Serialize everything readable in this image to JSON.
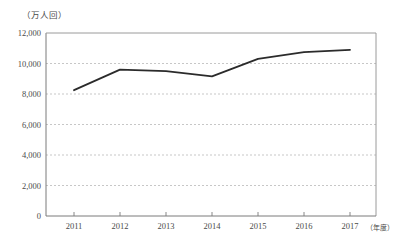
{
  "chart_data": {
    "type": "line",
    "title": "",
    "subtitle": "",
    "unit_label": "（万人回）",
    "xlabel": "（年度）",
    "ylabel": "",
    "categories": [
      "2011",
      "2012",
      "2013",
      "2014",
      "2015",
      "2016",
      "2017"
    ],
    "values": [
      8250,
      9600,
      9500,
      9150,
      10300,
      10750,
      10900
    ],
    "series": [
      {
        "name": "",
        "values": [
          8250,
          9600,
          9500,
          9150,
          10300,
          10750,
          10900
        ]
      }
    ],
    "ylim": [
      0,
      12000
    ],
    "ytick_labels": [
      "0",
      "2,000",
      "4,000",
      "6,000",
      "8,000",
      "10,000",
      "12,000"
    ],
    "ytick_values": [
      0,
      2000,
      4000,
      6000,
      8000,
      10000,
      12000
    ],
    "xtick_labels": [
      "2011",
      "2012",
      "2013",
      "2014",
      "2015",
      "2016",
      "2017"
    ],
    "grid": true,
    "grid_axis": "y",
    "grid_style": "dashed",
    "legend": false,
    "legend_position": "none",
    "line_color": "#2b2b2b",
    "grid_color": "#b9b9b9",
    "axis_color": "#7a7a7a",
    "text_color": "#4a4a4a",
    "background_color": "#ffffff"
  }
}
